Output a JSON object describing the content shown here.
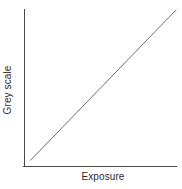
{
  "chart_data": {
    "type": "line",
    "title": "",
    "subtitle": "",
    "xlabel": "Exposure",
    "ylabel": "Grey scale",
    "xlim": [
      0,
      1
    ],
    "ylim": [
      0,
      1
    ],
    "grid": false,
    "legend": null,
    "xticklabels": [],
    "yticklabels": [],
    "annotations": [],
    "series": [
      {
        "name": "characteristic-curve",
        "x": [
          0.04,
          1.0
        ],
        "y": [
          0.04,
          1.0
        ],
        "color": "#6e6e6e",
        "style": "solid",
        "description": "Straight monotonically increasing line from lower-left to upper-right"
      }
    ]
  },
  "figure": {
    "background_color": "#ffffff",
    "axis_color": "#4a4a4a",
    "text_color": "#2b2b2b",
    "series_color": "#6e6e6e"
  },
  "axes": {
    "x_axis_name": "Exposure",
    "y_axis_name": "Grey scale"
  }
}
